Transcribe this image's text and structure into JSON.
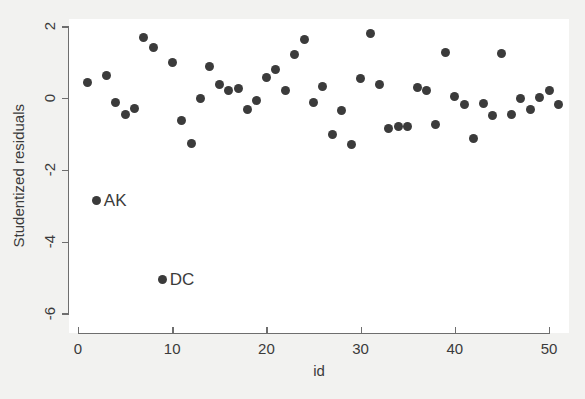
{
  "chart_data": {
    "type": "scatter",
    "title": "",
    "xlabel": "id",
    "ylabel": "Studentized residuals",
    "xlim": [
      0,
      51.5
    ],
    "ylim": [
      -6.1,
      2.25
    ],
    "xticks": [
      0,
      10,
      20,
      30,
      40,
      50
    ],
    "yticks": [
      2,
      0,
      -2,
      -4,
      -6
    ],
    "grid": false,
    "legend": "none",
    "marker_color": "#3b3b3b",
    "plot_background": "#ffffff",
    "figure_background": "#f2f2f0",
    "axis_color": "#6e6e6e",
    "points": [
      {
        "x": 1,
        "y": 0.43,
        "label": ""
      },
      {
        "x": 2,
        "y": -2.85,
        "label": "AK"
      },
      {
        "x": 3,
        "y": 0.62,
        "label": ""
      },
      {
        "x": 4,
        "y": -0.13,
        "label": ""
      },
      {
        "x": 5,
        "y": -0.45,
        "label": ""
      },
      {
        "x": 6,
        "y": -0.3,
        "label": ""
      },
      {
        "x": 7,
        "y": 1.68,
        "label": ""
      },
      {
        "x": 8,
        "y": 1.42,
        "label": ""
      },
      {
        "x": 9,
        "y": -5.05,
        "label": "DC"
      },
      {
        "x": 10,
        "y": 0.98,
        "label": ""
      },
      {
        "x": 11,
        "y": -0.62,
        "label": ""
      },
      {
        "x": 12,
        "y": -1.27,
        "label": ""
      },
      {
        "x": 13,
        "y": 0.0,
        "label": ""
      },
      {
        "x": 14,
        "y": 0.88,
        "label": ""
      },
      {
        "x": 15,
        "y": 0.38,
        "label": ""
      },
      {
        "x": 16,
        "y": 0.22,
        "label": ""
      },
      {
        "x": 17,
        "y": 0.27,
        "label": ""
      },
      {
        "x": 18,
        "y": -0.32,
        "label": ""
      },
      {
        "x": 19,
        "y": -0.07,
        "label": ""
      },
      {
        "x": 20,
        "y": 0.58,
        "label": ""
      },
      {
        "x": 21,
        "y": 0.78,
        "label": ""
      },
      {
        "x": 22,
        "y": 0.22,
        "label": ""
      },
      {
        "x": 23,
        "y": 1.2,
        "label": ""
      },
      {
        "x": 24,
        "y": 1.62,
        "label": ""
      },
      {
        "x": 25,
        "y": -0.13,
        "label": ""
      },
      {
        "x": 26,
        "y": 0.33,
        "label": ""
      },
      {
        "x": 27,
        "y": -1.03,
        "label": ""
      },
      {
        "x": 28,
        "y": -0.35,
        "label": ""
      },
      {
        "x": 29,
        "y": -1.3,
        "label": ""
      },
      {
        "x": 30,
        "y": 0.55,
        "label": ""
      },
      {
        "x": 31,
        "y": 1.8,
        "label": ""
      },
      {
        "x": 32,
        "y": 0.38,
        "label": ""
      },
      {
        "x": 33,
        "y": -0.85,
        "label": ""
      },
      {
        "x": 34,
        "y": -0.8,
        "label": ""
      },
      {
        "x": 35,
        "y": -0.78,
        "label": ""
      },
      {
        "x": 36,
        "y": 0.28,
        "label": ""
      },
      {
        "x": 37,
        "y": 0.22,
        "label": ""
      },
      {
        "x": 38,
        "y": -0.73,
        "label": ""
      },
      {
        "x": 39,
        "y": 1.28,
        "label": ""
      },
      {
        "x": 40,
        "y": 0.03,
        "label": ""
      },
      {
        "x": 41,
        "y": -0.18,
        "label": ""
      },
      {
        "x": 42,
        "y": -1.12,
        "label": ""
      },
      {
        "x": 43,
        "y": -0.15,
        "label": ""
      },
      {
        "x": 44,
        "y": -0.48,
        "label": ""
      },
      {
        "x": 45,
        "y": 1.25,
        "label": ""
      },
      {
        "x": 46,
        "y": -0.45,
        "label": ""
      },
      {
        "x": 47,
        "y": -0.02,
        "label": ""
      },
      {
        "x": 48,
        "y": -0.32,
        "label": ""
      },
      {
        "x": 49,
        "y": 0.02,
        "label": ""
      },
      {
        "x": 50,
        "y": 0.2,
        "label": ""
      },
      {
        "x": 51,
        "y": -0.17,
        "label": ""
      }
    ]
  }
}
